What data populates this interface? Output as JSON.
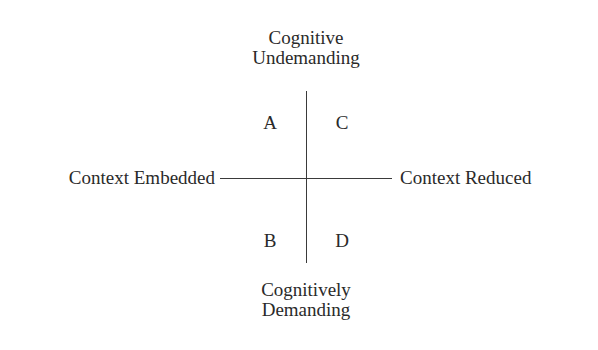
{
  "diagram": {
    "type": "quadrant-model",
    "vertical_axis": {
      "top_label_line1": "Cognitive",
      "top_label_line2": "Undemanding",
      "bottom_label_line1": "Cognitively",
      "bottom_label_line2": "Demanding"
    },
    "horizontal_axis": {
      "left_label": "Context Embedded",
      "right_label": "Context Reduced"
    },
    "quadrants": {
      "top_left": "A",
      "top_right": "C",
      "bottom_left": "B",
      "bottom_right": "D"
    },
    "colors": {
      "text": "#2a2a2a",
      "lines": "#3a3a3a",
      "background": "#ffffff"
    }
  }
}
